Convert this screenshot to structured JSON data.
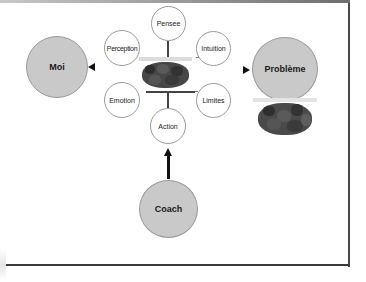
{
  "diagram": {
    "nodes": {
      "moi": {
        "label": "Moi"
      },
      "probleme": {
        "label": "Problème"
      },
      "coach": {
        "label": "Coach"
      },
      "pensee": {
        "label": "Pensee"
      },
      "perception": {
        "label": "Perception"
      },
      "intuition": {
        "label": "Intuition"
      },
      "emotion": {
        "label": "Emotion"
      },
      "limites": {
        "label": "Limites"
      },
      "action": {
        "label": "Action"
      }
    },
    "images": {
      "center": "raisins-photo",
      "probleme": "raisins-photo"
    },
    "colors": {
      "big_circle_fill": "#c9c9c9",
      "small_circle_fill": "#ffffff",
      "circle_border": "#9a9a9a",
      "arrow": "#111111",
      "raisin": "#3e3e3e"
    },
    "arrows": [
      {
        "from": "center",
        "to": "moi",
        "direction": "left"
      },
      {
        "from": "center",
        "to": "probleme",
        "direction": "right"
      },
      {
        "from": "coach",
        "to": "action",
        "direction": "up"
      }
    ]
  }
}
